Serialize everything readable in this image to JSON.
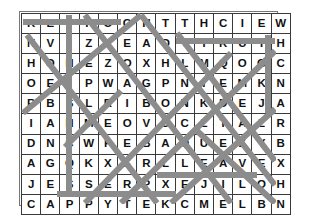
{
  "puzzle": {
    "type": "word-search",
    "rows": 10,
    "cols": 14,
    "grid": [
      [
        "R",
        "E",
        "F",
        "F",
        "O",
        "G",
        "H",
        "T",
        "T",
        "H",
        "C",
        "I",
        "E",
        "W"
      ],
      [
        "N",
        "V",
        "I",
        "Z",
        "L",
        "E",
        "A",
        "O",
        "T",
        "T",
        "R",
        "U",
        "T",
        "H"
      ],
      [
        "H",
        "O",
        "N",
        "E",
        "Z",
        "O",
        "X",
        "H",
        "L",
        "M",
        "Q",
        "O",
        "G",
        "C"
      ],
      [
        "O",
        "E",
        "I",
        "P",
        "W",
        "A",
        "G",
        "P",
        "N",
        "I",
        "E",
        "M",
        "K",
        "N"
      ],
      [
        "R",
        "B",
        "S",
        "L",
        "R",
        "I",
        "B",
        "O",
        "N",
        "K",
        "D",
        "E",
        "J",
        "A"
      ],
      [
        "I",
        "A",
        "H",
        "M",
        "E",
        "O",
        "V",
        "U",
        "C",
        "L",
        "T",
        "A",
        "Z",
        "R"
      ],
      [
        "D",
        "N",
        "C",
        "W",
        "P",
        "E",
        "B",
        "A",
        "Q",
        "U",
        "E",
        "Z",
        "Y",
        "B"
      ],
      [
        "A",
        "G",
        "Q",
        "K",
        "X",
        "E",
        "R",
        "L",
        "L",
        "E",
        "A",
        "V",
        "E",
        "X"
      ],
      [
        "J",
        "E",
        "S",
        "S",
        "E",
        "R",
        "P",
        "X",
        "E",
        "J",
        "I",
        "L",
        "O",
        "H"
      ],
      [
        "C",
        "A",
        "P",
        "P",
        "Y",
        "T",
        "E",
        "K",
        "C",
        "M",
        "E",
        "L",
        "B",
        "N"
      ]
    ],
    "colors": {
      "grid_line": "#3a3a3a",
      "letter": "#111111",
      "strike": "#8c8c8c",
      "background": "#ffffff",
      "outer_border": "#767676"
    },
    "strikes": [
      {
        "name": "strike-row1-horizontal",
        "x1": 2,
        "y1": 9,
        "x2": 100,
        "y2": 9,
        "w": 6
      },
      {
        "name": "strike-row2-horizontal",
        "x1": 155,
        "y1": 28,
        "x2": 254,
        "y2": 28,
        "w": 6
      },
      {
        "name": "strike-row8-horizontal",
        "x1": 136,
        "y1": 162,
        "x2": 236,
        "y2": 162,
        "w": 6
      },
      {
        "name": "strike-row9-horizontal",
        "x1": 36,
        "y1": 181,
        "x2": 155,
        "y2": 181,
        "w": 6
      },
      {
        "name": "strike-col3-vertical",
        "x1": 48,
        "y1": 2,
        "x2": 48,
        "y2": 182,
        "w": 6
      },
      {
        "name": "strike-col14-vertical",
        "x1": 247,
        "y1": 22,
        "x2": 247,
        "y2": 100,
        "w": 6
      },
      {
        "name": "strike-diag-down-a",
        "x1": 6,
        "y1": 22,
        "x2": 136,
        "y2": 190,
        "w": 6
      },
      {
        "name": "strike-diag-down-b",
        "x1": 64,
        "y1": 2,
        "x2": 210,
        "y2": 190,
        "w": 6
      },
      {
        "name": "strike-diag-down-c",
        "x1": 120,
        "y1": 2,
        "x2": 254,
        "y2": 172,
        "w": 6
      },
      {
        "name": "strike-diag-down-d",
        "x1": 156,
        "y1": 20,
        "x2": 254,
        "y2": 148,
        "w": 6
      },
      {
        "name": "strike-diag-down-e",
        "x1": 174,
        "y1": 116,
        "x2": 254,
        "y2": 190,
        "w": 6
      },
      {
        "name": "strike-diag-up-a",
        "x1": 2,
        "y1": 100,
        "x2": 120,
        "y2": 2,
        "w": 6
      },
      {
        "name": "strike-diag-up-b",
        "x1": 64,
        "y1": 190,
        "x2": 210,
        "y2": 40,
        "w": 6
      },
      {
        "name": "strike-diag-up-c",
        "x1": 100,
        "y1": 190,
        "x2": 254,
        "y2": 38,
        "w": 6
      },
      {
        "name": "strike-diag-up-d",
        "x1": 150,
        "y1": 190,
        "x2": 254,
        "y2": 96,
        "w": 6
      },
      {
        "name": "strike-diag-up-e",
        "x1": 44,
        "y1": 134,
        "x2": 100,
        "y2": 78,
        "w": 6
      }
    ]
  }
}
